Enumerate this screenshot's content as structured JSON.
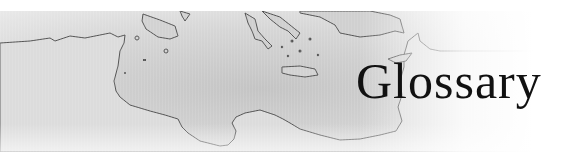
{
  "header": {
    "title": "Glossary",
    "image_description": "Grayscale map of the central and eastern Mediterranean coastline (North Africa, Sicily, Greece, Crete, Cyprus, Levant)"
  },
  "colors": {
    "background": "#ffffff",
    "map_sea": "#d9d9d9",
    "map_land": "#c9c9c9",
    "coastline": "#555555",
    "title_text": "#111111"
  }
}
